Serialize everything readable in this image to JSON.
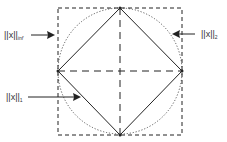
{
  "diagram": {
    "labels": {
      "inf_norm": {
        "main": "||x||",
        "sub": "inf"
      },
      "two_norm": {
        "main": "||x||",
        "sub": "2"
      },
      "one_norm": {
        "main": "||x||",
        "sub": "1"
      }
    },
    "shapes": {
      "square": "L-infinity unit ball (dashed square)",
      "circle": "L2 unit ball (dotted circle)",
      "diamond": "L1 unit ball (solid diamond)",
      "axes": "dashed coordinate axes"
    },
    "colors": {
      "stroke": "#222222",
      "text": "#333333",
      "background": "#ffffff"
    }
  }
}
